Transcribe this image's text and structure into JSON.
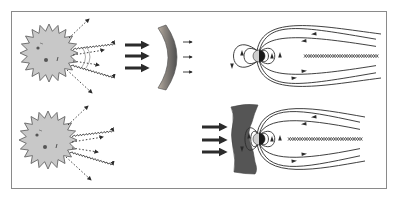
{
  "figure": {
    "panels": [
      {
        "id": "top",
        "description": "Sun emitting radiation and particles; a curved shield deflects the flow before the planet's magnetosphere",
        "shield_shape": "smooth-arc",
        "flow_arrows": 3,
        "transmitted_arrows": 3
      },
      {
        "id": "bottom",
        "description": "Sun emitting radiation and particles; the compressed bow shock sits directly against the magnetosphere",
        "shield_shape": "wavy-bow-shock",
        "flow_arrows": 3,
        "transmitted_arrows": 0
      }
    ]
  },
  "colors": {
    "frame": "#8a8a8a",
    "sun_fill": "#c8c8c8",
    "sun_stroke": "#555555",
    "line": "#2b2b2b",
    "shield_dark": "#555555",
    "shield_light": "#b8ada0",
    "earth_day": "#cfcfcf",
    "earth_night": "#1a1a1a"
  }
}
